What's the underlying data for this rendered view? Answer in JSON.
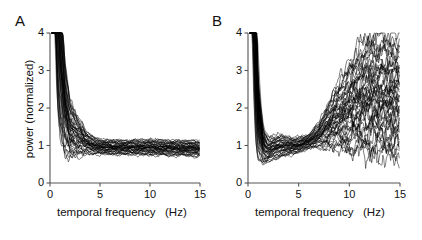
{
  "figure": {
    "background": "#ffffff",
    "line_color": "#000000",
    "axis_color": "#555555"
  },
  "panels": [
    {
      "id": "A",
      "label": "A",
      "xlabel": "temporal frequency   (Hz)",
      "ylabel": "power (normalized)",
      "show_ylabel": true
    },
    {
      "id": "B",
      "label": "B",
      "xlabel": "temporal frequency   (Hz)",
      "ylabel": "",
      "show_ylabel": false
    }
  ],
  "axes": {
    "xticks": [
      0,
      5,
      10,
      15
    ],
    "xticklabels": [
      "0",
      "5",
      "10",
      "15"
    ],
    "yticks": [
      0,
      1,
      2,
      3,
      4
    ],
    "yticklabels": [
      "0",
      "1",
      "2",
      "3",
      "4"
    ],
    "xlim": [
      0,
      15
    ],
    "ylim": [
      0,
      4
    ],
    "grid": false
  },
  "chart_data": {
    "type": "line",
    "title": "",
    "xlabel": "temporal frequency   (Hz)",
    "ylabel": "power (normalized)",
    "xlim": [
      0,
      15
    ],
    "ylim": [
      0,
      4
    ],
    "xticks": [
      0,
      5,
      10,
      15
    ],
    "yticks": [
      0,
      1,
      2,
      3,
      4
    ],
    "grid": false,
    "legend": "none",
    "panels": [
      {
        "panel": "A",
        "n_traces": 45,
        "x": [
          0.25,
          0.5,
          0.75,
          1,
          1.5,
          2,
          2.5,
          3,
          3.5,
          4,
          4.5,
          5,
          6,
          7,
          8,
          9,
          10,
          11,
          12,
          13,
          14,
          15
        ],
        "envelope_low": [
          4.0,
          2.1,
          1.15,
          0.8,
          0.62,
          0.62,
          0.68,
          0.72,
          0.74,
          0.76,
          0.76,
          0.76,
          0.75,
          0.75,
          0.74,
          0.74,
          0.73,
          0.73,
          0.72,
          0.72,
          0.71,
          0.7
        ],
        "envelope_high": [
          4.0,
          4.0,
          4.0,
          3.6,
          2.7,
          2.25,
          1.95,
          1.7,
          1.45,
          1.3,
          1.22,
          1.18,
          1.16,
          1.15,
          1.16,
          1.16,
          1.18,
          1.16,
          1.15,
          1.15,
          1.14,
          1.14
        ],
        "median": [
          4.0,
          3.2,
          1.95,
          1.35,
          1.05,
          1.0,
          1.0,
          1.0,
          0.99,
          0.98,
          0.97,
          0.96,
          0.95,
          0.95,
          0.95,
          0.95,
          0.95,
          0.94,
          0.94,
          0.93,
          0.93,
          0.92
        ]
      },
      {
        "panel": "B",
        "n_traces": 45,
        "x": [
          0.25,
          0.5,
          0.75,
          1,
          1.5,
          2,
          2.5,
          3,
          3.5,
          4,
          4.5,
          5,
          5.5,
          6,
          6.5,
          7,
          8,
          9,
          10,
          11,
          12,
          13,
          14,
          15
        ],
        "envelope_low": [
          4.0,
          1.6,
          0.6,
          0.38,
          0.4,
          0.52,
          0.62,
          0.66,
          0.7,
          0.72,
          0.76,
          0.8,
          0.86,
          0.9,
          0.92,
          0.92,
          0.88,
          0.84,
          0.78,
          0.72,
          0.68,
          0.64,
          0.62,
          0.6
        ],
        "envelope_high": [
          4.0,
          4.0,
          3.3,
          1.95,
          1.3,
          1.22,
          1.26,
          1.3,
          1.28,
          1.24,
          1.22,
          1.22,
          1.26,
          1.32,
          1.45,
          1.62,
          2.2,
          2.75,
          3.25,
          3.7,
          4.0,
          4.0,
          4.0,
          4.0
        ],
        "median": [
          4.0,
          3.1,
          1.2,
          0.72,
          0.72,
          0.84,
          0.92,
          0.96,
          0.98,
          0.99,
          1.0,
          1.02,
          1.05,
          1.08,
          1.12,
          1.18,
          1.34,
          1.52,
          1.72,
          1.92,
          2.1,
          2.22,
          2.3,
          2.32
        ]
      }
    ]
  }
}
